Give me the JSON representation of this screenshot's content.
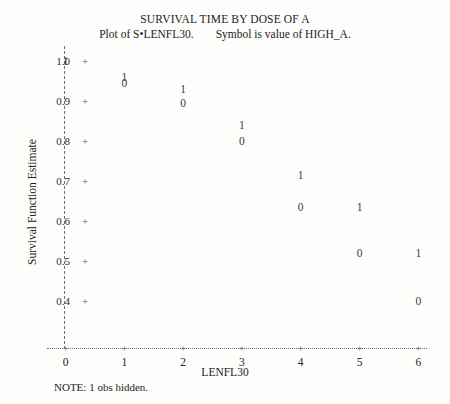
{
  "titles": {
    "main": "SURVIVAL TIME BY DOSE OF A",
    "sub_left": "Plot of S•LENFL30.",
    "sub_right": "Symbol is value of HIGH_A."
  },
  "footnote": "NOTE: 1 obs hidden.",
  "chart_data": {
    "type": "scatter",
    "title": "SURVIVAL TIME BY DOSE OF A",
    "subtitle": "Plot of S•LENFL30.    Symbol is value of HIGH_A.",
    "xlabel": "LENFL30",
    "ylabel": "Survival Function Estimate",
    "xlim": [
      0,
      6
    ],
    "ylim": [
      0.4,
      1.0
    ],
    "xticks": [
      0,
      1,
      2,
      3,
      4,
      5,
      6
    ],
    "xtick_labels": [
      "0",
      "1",
      "2",
      "3",
      "4",
      "5",
      "6"
    ],
    "yticks": [
      0.4,
      0.5,
      0.6,
      0.7,
      0.8,
      0.9,
      1.0
    ],
    "ytick_labels": [
      "0.4",
      "0.5",
      "0.6",
      "0.7",
      "0.8",
      "0.9",
      "1.0"
    ],
    "grid": false,
    "legend": null,
    "marker_style": "digit-symbol",
    "symbol_meaning": "Symbol is value of HIGH_A",
    "series": [
      {
        "name": "HIGH_A = 1",
        "symbol": "1",
        "x": [
          0,
          1,
          2,
          3,
          4,
          5,
          6
        ],
        "y": [
          1.0,
          0.96,
          0.93,
          0.84,
          0.715,
          0.635,
          0.52
        ]
      },
      {
        "name": "HIGH_A = 0",
        "symbol": "0",
        "x": [
          1,
          2,
          3,
          4,
          5,
          6
        ],
        "y": [
          0.945,
          0.895,
          0.8,
          0.635,
          0.52,
          0.4
        ]
      }
    ],
    "points": [
      {
        "x": 0,
        "y": 1.0,
        "symbol": "1"
      },
      {
        "x": 1,
        "y": 0.96,
        "symbol": "1"
      },
      {
        "x": 1,
        "y": 0.945,
        "symbol": "0"
      },
      {
        "x": 2,
        "y": 0.93,
        "symbol": "1"
      },
      {
        "x": 2,
        "y": 0.895,
        "symbol": "0"
      },
      {
        "x": 3,
        "y": 0.84,
        "symbol": "1"
      },
      {
        "x": 3,
        "y": 0.8,
        "symbol": "0"
      },
      {
        "x": 4,
        "y": 0.715,
        "symbol": "1"
      },
      {
        "x": 4,
        "y": 0.635,
        "symbol": "0"
      },
      {
        "x": 5,
        "y": 0.635,
        "symbol": "1"
      },
      {
        "x": 5,
        "y": 0.52,
        "symbol": "0"
      },
      {
        "x": 6,
        "y": 0.52,
        "symbol": "1"
      },
      {
        "x": 6,
        "y": 0.4,
        "symbol": "0"
      }
    ],
    "note": "NOTE: 1 obs hidden.",
    "tick_glyph": "+"
  },
  "colors": {
    "text": "#232323",
    "axis": "#6f6f6f",
    "marker": "#3b3b3b",
    "background": "#fdfdfc"
  }
}
